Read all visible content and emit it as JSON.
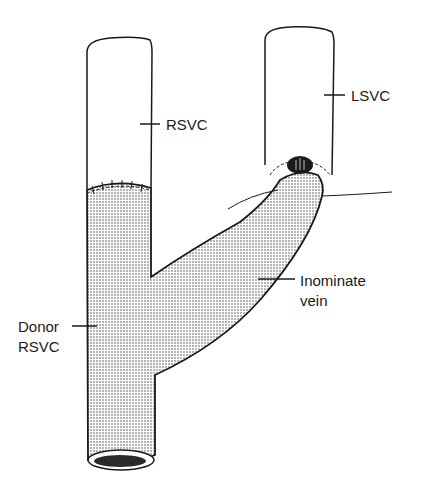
{
  "labels": {
    "rsvc": "RSVC",
    "lsvc": "LSVC",
    "donor_line1": "Donor",
    "donor_line2": "RSVC",
    "innominate_line1": "Inominate",
    "innominate_line2": "vein"
  },
  "colors": {
    "ink": "#1a1a1a",
    "background": "#ffffff",
    "stipple": "#555555"
  }
}
